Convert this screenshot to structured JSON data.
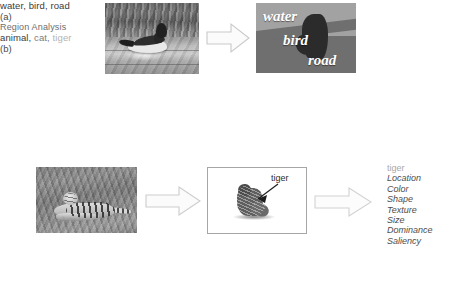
{
  "figure": {
    "panels": [
      {
        "letter": "(a)",
        "input_photo_name": "duck-on-water-photograph",
        "output_name": "semantic-segmentation-map",
        "tags_caption": "water, bird, road",
        "tags": [
          {
            "text": "water",
            "weight": "strong"
          },
          {
            "text": "bird",
            "weight": "strong"
          },
          {
            "text": "road",
            "weight": "strong"
          }
        ],
        "segment_labels": [
          {
            "text": "water",
            "region": "water"
          },
          {
            "text": "bird",
            "region": "bird"
          },
          {
            "text": "road",
            "region": "road"
          }
        ]
      },
      {
        "letter": "(b)",
        "input_photo_name": "tiger-on-grass-photograph",
        "tags": [
          {
            "text": "animal,",
            "weight": "strong"
          },
          {
            "text": "cat,",
            "weight": "mid"
          },
          {
            "text": "tiger",
            "weight": "weak"
          }
        ],
        "region_box": {
          "name": "segmented-region-box",
          "annotation": "tiger"
        },
        "region_analysis": {
          "heading": "Region Analysis",
          "subject": "tiger",
          "attributes": [
            "Location",
            "Color",
            "Shape",
            "Texture",
            "Size",
            "Dominance",
            "Saliency"
          ]
        }
      }
    ],
    "arrows": [
      {
        "name": "arrow-a-photo-to-segmap"
      },
      {
        "name": "arrow-b-photo-to-region"
      },
      {
        "name": "arrow-b-region-to-analysis"
      }
    ],
    "colors": {
      "background": "#ffffff",
      "caption_text": "#3b3b3b",
      "heading_text": "#6d6d6d",
      "attr_text": "#4d4d4d",
      "attr_head_text": "#a9a9a9",
      "tag_strong": "#3a3a3a",
      "tag_mid": "#7d7d7d",
      "tag_weak": "#b4b4b4",
      "arrow_outline": "#c9c9c9",
      "arrow_fill": "#fbfbfb",
      "box_border": "#a6a6a6",
      "segment_label": "#ffffff"
    }
  }
}
